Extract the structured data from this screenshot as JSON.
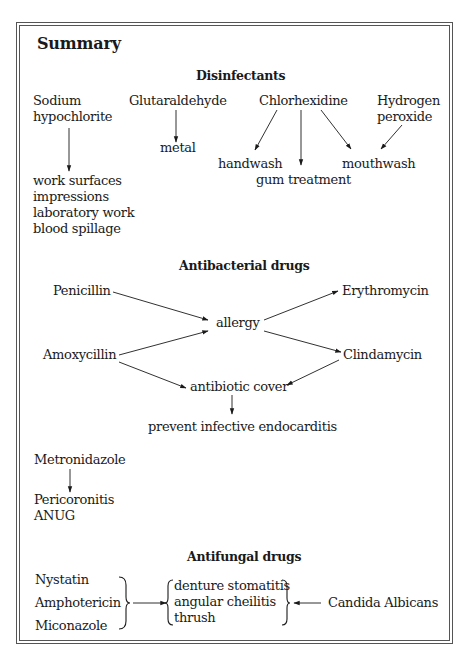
{
  "title": "Summary",
  "sections": {
    "disinfectants": {
      "heading": "Disinfectants",
      "agents": {
        "sodium_hypochlorite": "Sodium\nhypochlorite",
        "glutaraldehyde": "Glutaraldehyde",
        "chlorhexidine": "Chlorhexidine",
        "hydrogen_peroxide": "Hydrogen\nperoxide"
      },
      "uses": {
        "sodium_hypochlorite": "work surfaces\nimpressions\nlaboratory work\nblood spillage",
        "metal": "metal",
        "handwash": "handwash",
        "gum_treatment": "gum treatment",
        "mouthwash": "mouthwash"
      }
    },
    "antibacterial": {
      "heading": "Antibacterial drugs",
      "nodes": {
        "penicillin": "Penicillin",
        "amoxycillin": "Amoxycillin",
        "allergy": "allergy",
        "erythromycin": "Erythromycin",
        "clindamycin": "Clindamycin",
        "antibiotic_cover": "antibiotic cover",
        "prevent": "prevent infective endocarditis",
        "metronidazole": "Metronidazole",
        "metronidazole_uses": "Pericoronitis\nANUG"
      }
    },
    "antifungal": {
      "heading": "Antifungal drugs",
      "drugs": [
        "Nystatin",
        "Amphotericin",
        "Miconazole"
      ],
      "conditions": [
        "denture stomatitis",
        "angular cheilitis",
        "thrush"
      ],
      "cause": "Candida Albicans"
    }
  },
  "edges": [
    {
      "from": "Sodium hypochlorite",
      "to": "work surfaces / impressions / laboratory work / blood spillage"
    },
    {
      "from": "Glutaraldehyde",
      "to": "metal"
    },
    {
      "from": "Chlorhexidine",
      "to": "handwash"
    },
    {
      "from": "Chlorhexidine",
      "to": "gum treatment"
    },
    {
      "from": "Chlorhexidine",
      "to": "mouthwash"
    },
    {
      "from": "Hydrogen peroxide",
      "to": "mouthwash"
    },
    {
      "from": "Penicillin",
      "to": "allergy"
    },
    {
      "from": "Amoxycillin",
      "to": "allergy"
    },
    {
      "from": "allergy",
      "to": "Erythromycin"
    },
    {
      "from": "allergy",
      "to": "Clindamycin"
    },
    {
      "from": "Amoxycillin",
      "to": "antibiotic cover"
    },
    {
      "from": "Clindamycin",
      "to": "antibiotic cover"
    },
    {
      "from": "antibiotic cover",
      "to": "prevent infective endocarditis"
    },
    {
      "from": "Metronidazole",
      "to": "Pericoronitis / ANUG"
    },
    {
      "from": "Nystatin / Amphotericin / Miconazole",
      "to": "denture stomatitis / angular cheilitis / thrush"
    },
    {
      "from": "Candida Albicans",
      "to": "denture stomatitis / angular cheilitis / thrush"
    }
  ],
  "colors": {
    "text": "#1a1a1a",
    "border": "#555555",
    "background": "#ffffff"
  }
}
